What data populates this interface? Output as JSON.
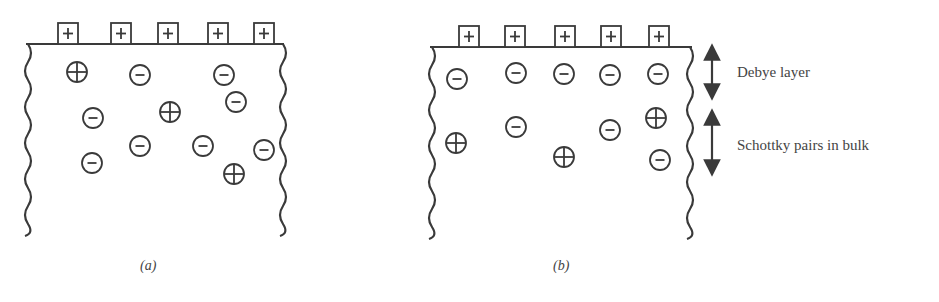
{
  "colors": {
    "ink": "#3a3a3a",
    "text": "#444444",
    "background": "#ffffff"
  },
  "panels": [
    {
      "id": "a",
      "caption": "(a)",
      "surface_charges": [
        {
          "sign": "+",
          "x": 68
        },
        {
          "sign": "+",
          "x": 121
        },
        {
          "sign": "+",
          "x": 168
        },
        {
          "sign": "+",
          "x": 218
        },
        {
          "sign": "+",
          "x": 264
        }
      ],
      "ions": [
        {
          "sign": "+",
          "x": 77,
          "y": 72
        },
        {
          "sign": "-",
          "x": 140,
          "y": 75
        },
        {
          "sign": "-",
          "x": 224,
          "y": 75
        },
        {
          "sign": "-",
          "x": 236,
          "y": 102
        },
        {
          "sign": "-",
          "x": 93,
          "y": 118
        },
        {
          "sign": "+",
          "x": 170,
          "y": 112
        },
        {
          "sign": "-",
          "x": 140,
          "y": 146
        },
        {
          "sign": "-",
          "x": 203,
          "y": 146
        },
        {
          "sign": "-",
          "x": 264,
          "y": 150
        },
        {
          "sign": "-",
          "x": 92,
          "y": 163
        },
        {
          "sign": "+",
          "x": 234,
          "y": 174
        }
      ]
    },
    {
      "id": "b",
      "caption": "(b)",
      "surface_charges": [
        {
          "sign": "+",
          "x": 469
        },
        {
          "sign": "+",
          "x": 515
        },
        {
          "sign": "+",
          "x": 565
        },
        {
          "sign": "+",
          "x": 611
        },
        {
          "sign": "+",
          "x": 659
        }
      ],
      "ions": [
        {
          "sign": "-",
          "x": 457,
          "y": 79
        },
        {
          "sign": "-",
          "x": 516,
          "y": 73
        },
        {
          "sign": "-",
          "x": 564,
          "y": 74
        },
        {
          "sign": "-",
          "x": 610,
          "y": 75
        },
        {
          "sign": "-",
          "x": 658,
          "y": 74
        },
        {
          "sign": "-",
          "x": 516,
          "y": 127
        },
        {
          "sign": "-",
          "x": 610,
          "y": 130
        },
        {
          "sign": "+",
          "x": 656,
          "y": 118
        },
        {
          "sign": "+",
          "x": 456,
          "y": 143
        },
        {
          "sign": "+",
          "x": 564,
          "y": 157
        },
        {
          "sign": "-",
          "x": 660,
          "y": 160
        }
      ]
    }
  ],
  "annotations": {
    "debye_layer": "Debye layer",
    "schottky_pairs": "Schottky pairs in bulk"
  }
}
